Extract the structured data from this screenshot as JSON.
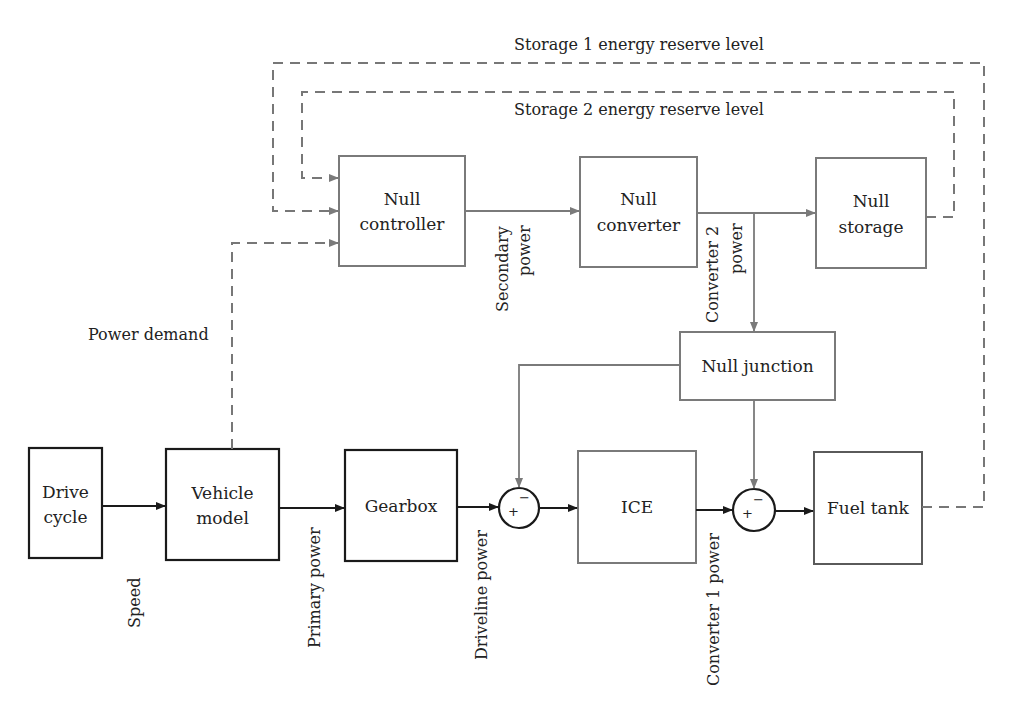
{
  "diagram": {
    "colors": {
      "primary": "#1a1a1a",
      "secondary": "#7a7a7a",
      "dashed": "#777777"
    },
    "blocks": {
      "drive_cycle": [
        "Drive",
        "cycle"
      ],
      "vehicle_model": [
        "Vehicle",
        "model"
      ],
      "gearbox": [
        "Gearbox"
      ],
      "ice": [
        "ICE"
      ],
      "fuel_tank": [
        "Fuel tank"
      ],
      "null_controller": [
        "Null",
        "controller"
      ],
      "null_converter": [
        "Null",
        "converter"
      ],
      "null_storage": [
        "Null",
        "storage"
      ],
      "null_junction": [
        "Null junction"
      ]
    },
    "summing_junctions": [
      {
        "plus": "+",
        "minus": "−"
      },
      {
        "plus": "+",
        "minus": "−"
      }
    ],
    "signals": {
      "speed": "Speed",
      "primary_power": "Primary power",
      "driveline_power": "Driveline power",
      "converter1_power": "Converter 1 power",
      "secondary_power": [
        "Secondary",
        "power"
      ],
      "converter2_power": [
        "Converter 2",
        "power"
      ],
      "power_demand": "Power demand",
      "storage1_level": "Storage 1 energy reserve level",
      "storage2_level": "Storage 2 energy reserve level"
    }
  }
}
